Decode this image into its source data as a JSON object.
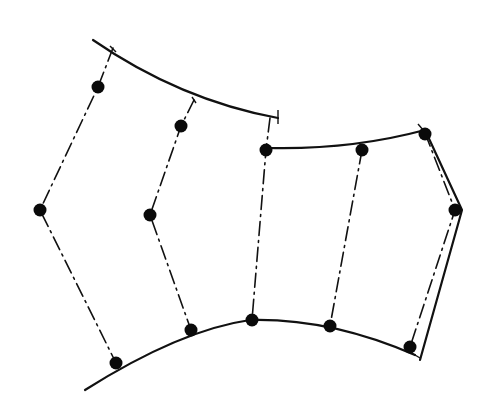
{
  "diagram": {
    "colors": {
      "ink": "#111111",
      "background": "#ffffff"
    },
    "curves": [
      {
        "name": "upper-left-arc",
        "d": "M93,40 Q180,100 278,118"
      },
      {
        "name": "upper-right-arc",
        "d": "M268,148 Q350,150 425,130"
      },
      {
        "name": "lower-arc",
        "d": "M85,390 Q180,330 250,320 Q330,318 415,355"
      },
      {
        "name": "right-edge",
        "d": "M425,130 L462,210 L420,360"
      }
    ],
    "tick_marks": [
      {
        "x1": 110,
        "y1": 46,
        "x2": 116,
        "y2": 52
      },
      {
        "x1": 192,
        "y1": 97,
        "x2": 196,
        "y2": 103
      },
      {
        "x1": 278,
        "y1": 110,
        "x2": 278,
        "y2": 124
      },
      {
        "x1": 418,
        "y1": 124,
        "x2": 430,
        "y2": 138
      },
      {
        "x1": 410,
        "y1": 352,
        "x2": 420,
        "y2": 358
      }
    ],
    "dashdot_lines": [
      {
        "points": "113,48 98,87 40,210 116,363"
      },
      {
        "points": "194,100 181,126 150,215 191,330"
      },
      {
        "points": "270,118 266,150 252,320"
      },
      {
        "points": "362,150 330,326"
      },
      {
        "points": "425,133 455,210 410,347"
      }
    ],
    "nodes": [
      {
        "x": 98,
        "y": 87
      },
      {
        "x": 40,
        "y": 210
      },
      {
        "x": 116,
        "y": 363
      },
      {
        "x": 181,
        "y": 126
      },
      {
        "x": 150,
        "y": 215
      },
      {
        "x": 191,
        "y": 330
      },
      {
        "x": 266,
        "y": 150
      },
      {
        "x": 252,
        "y": 320
      },
      {
        "x": 362,
        "y": 150
      },
      {
        "x": 330,
        "y": 326
      },
      {
        "x": 425,
        "y": 134
      },
      {
        "x": 455,
        "y": 210
      },
      {
        "x": 410,
        "y": 347
      }
    ]
  }
}
